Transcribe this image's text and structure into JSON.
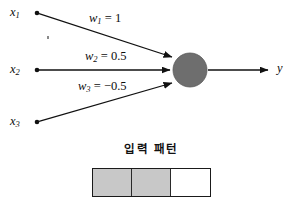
{
  "figure": {
    "type": "neuron-diagram",
    "background_color": "#ffffff",
    "line_color": "#111111",
    "neuron_fill_color": "#6e6e6e",
    "cell_fill_color": "#c8c8c8"
  },
  "inputs": [
    {
      "name": "x1-node",
      "label_base": "x",
      "label_sub": "1",
      "x": 37,
      "y": 13
    },
    {
      "name": "x2-node",
      "label_base": "x",
      "label_sub": "2",
      "x": 37,
      "y": 70
    },
    {
      "name": "x3-node",
      "label_base": "x",
      "label_sub": "3",
      "x": 37,
      "y": 122
    }
  ],
  "weights": [
    {
      "name": "w1",
      "base": "w",
      "sub": "1",
      "equals": "=",
      "value": "1"
    },
    {
      "name": "w2",
      "base": "w",
      "sub": "2",
      "equals": "=",
      "value": "0.5"
    },
    {
      "name": "w3",
      "base": "w",
      "sub": "3",
      "equals": "=",
      "value": "−0.5"
    }
  ],
  "neuron": {
    "name": "neuron-body",
    "cx": 190,
    "cy": 70,
    "r": 17,
    "fill": "#6e6e6e"
  },
  "output": {
    "name": "output-y",
    "label": "y",
    "arrow_from_x": 208,
    "arrow_to_x": 268,
    "y": 70
  },
  "pattern": {
    "caption": "입력 패턴",
    "cells": [
      {
        "name": "pattern-cell-1",
        "filled": true,
        "fill": "#c8c8c8"
      },
      {
        "name": "pattern-cell-2",
        "filled": true,
        "fill": "#c8c8c8"
      },
      {
        "name": "pattern-cell-3",
        "filled": false,
        "fill": "#ffffff"
      }
    ]
  }
}
